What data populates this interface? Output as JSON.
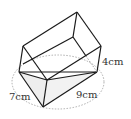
{
  "figure": {
    "type": "triangular prism with base inscribed in circle",
    "labels": {
      "side_left": "7cm",
      "side_right": "9cm",
      "height": "4cm"
    },
    "colors": {
      "stroke": "#1a1a1a",
      "shade": "#eeeeee",
      "dotted": "#999999",
      "text": "#333333"
    }
  }
}
